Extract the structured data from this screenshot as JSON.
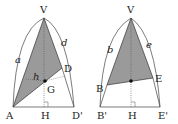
{
  "figures": [
    {
      "id": "left",
      "points": {
        "V": {
          "label": "V",
          "x": 44,
          "y": 18
        },
        "A": {
          "label": "A",
          "x": 13,
          "y": 107
        },
        "D": {
          "label": "D",
          "x": 62,
          "y": 68
        },
        "D_prime": {
          "label": "D'",
          "x": 74,
          "y": 107
        },
        "H": {
          "label": "H",
          "x": 44,
          "y": 107
        },
        "G": {
          "label": "G",
          "x": 45,
          "y": 81
        }
      },
      "edge_labels": {
        "a": "a",
        "d": "d",
        "h": "h"
      },
      "shaded_triangle": [
        "V",
        "A",
        "D"
      ],
      "shade_color": "#9a9a9a"
    },
    {
      "id": "right",
      "points": {
        "V": {
          "label": "V",
          "x": 131,
          "y": 18
        },
        "B": {
          "label": "B",
          "x": 107,
          "y": 85
        },
        "E": {
          "label": "E",
          "x": 153,
          "y": 78
        },
        "B_prime": {
          "label": "B'",
          "x": 100,
          "y": 107
        },
        "E_prime": {
          "label": "E'",
          "x": 160,
          "y": 107
        },
        "H": {
          "label": "H",
          "x": 131,
          "y": 107
        },
        "G": {
          "label": "",
          "x": 131,
          "y": 81
        }
      },
      "edge_labels": {
        "b": "b",
        "e": "e"
      },
      "shaded_triangle": [
        "V",
        "B",
        "E"
      ],
      "shade_color": "#9a9a9a"
    }
  ],
  "angle_marks": [
    "a",
    "b",
    "c"
  ]
}
